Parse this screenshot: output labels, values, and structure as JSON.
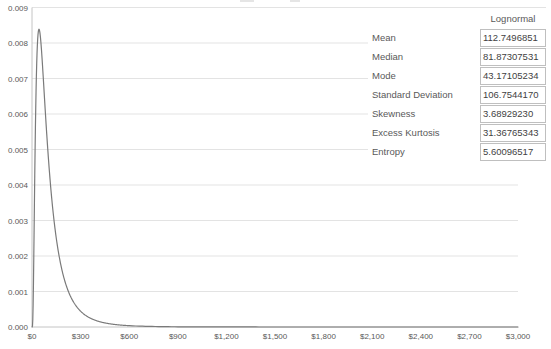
{
  "colors": {
    "curve": "#7a7a7a",
    "gridline": "#e3e3e3",
    "axis": "#c4c4c4",
    "tick_text": "#595959",
    "value_text": "#3f3f3f",
    "box_border": "#bfbfbf",
    "background": "#ffffff"
  },
  "chart_data": {
    "type": "line",
    "title": "",
    "xlabel": "",
    "ylabel": "",
    "xlim": [
      0,
      3000
    ],
    "ylim": [
      0,
      0.009
    ],
    "grid": true,
    "legend_position": "none",
    "series": [
      {
        "name": "Lognormal",
        "distribution": "lognormal",
        "params": {
          "mu": 4.405166,
          "sigma": 0.8
        },
        "color": "#7a7a7a"
      }
    ],
    "peak": {
      "x": 43.17105234,
      "y": 0.008388
    },
    "x_ticks": {
      "values": [
        0,
        300,
        600,
        900,
        1200,
        1500,
        1800,
        2100,
        2400,
        2700,
        3000
      ],
      "labels": [
        "$0",
        "$300",
        "$600",
        "$900",
        "$1,200",
        "$1,500",
        "$1,800",
        "$2,100",
        "$2,400",
        "$2,700",
        "$3,000"
      ]
    },
    "y_ticks": {
      "values": [
        0,
        0.001,
        0.002,
        0.003,
        0.004,
        0.005,
        0.006,
        0.007,
        0.008,
        0.009
      ],
      "labels": [
        "0.000",
        "0.001",
        "0.002",
        "0.003",
        "0.004",
        "0.005",
        "0.006",
        "0.007",
        "0.008",
        "0.009"
      ]
    },
    "stats": {
      "header": "Lognormal",
      "rows": [
        {
          "label": "Mean",
          "value": "112.7496851"
        },
        {
          "label": "Median",
          "value": "81.87307531"
        },
        {
          "label": "Mode",
          "value": "43.17105234"
        },
        {
          "label": "Standard Deviation",
          "value": "106.7544170"
        },
        {
          "label": "Skewness",
          "value": "3.68929230"
        },
        {
          "label": "Excess Kurtosis",
          "value": "31.36765343"
        },
        {
          "label": "Entropy",
          "value": "5.60096517"
        }
      ]
    }
  }
}
